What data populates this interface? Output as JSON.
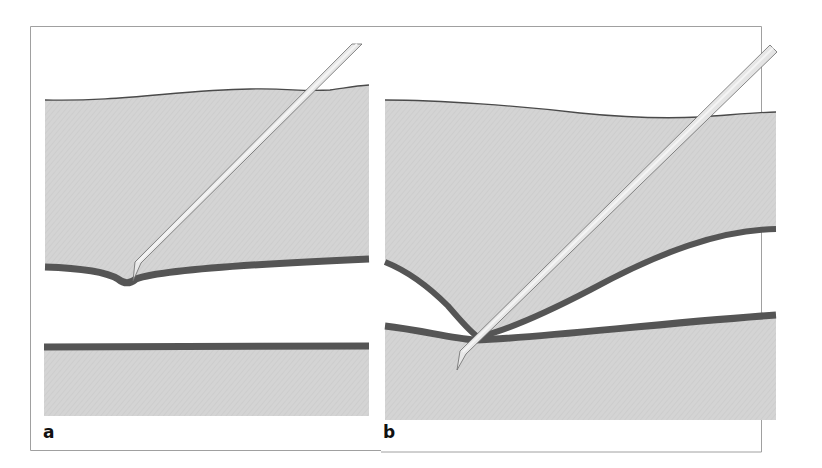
{
  "figure": {
    "panels": [
      {
        "label": "a",
        "description": "Needle tip indents the upper membrane layer without penetrating; lower layer flat"
      },
      {
        "label": "b",
        "description": "Needle pushes upper membrane down onto lower layer and penetrates both"
      }
    ],
    "colors": {
      "tissue": "#d2d2d2",
      "membrane": "#5a5a5a",
      "needle_light": "#e4e4e4",
      "needle_dark": "#8a8a8a",
      "frame": "#9a9a9a",
      "background": "#ffffff"
    }
  }
}
